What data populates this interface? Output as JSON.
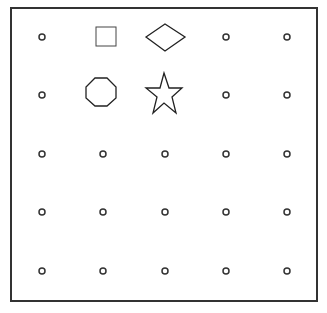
{
  "diagram": {
    "type": "grid-with-shapes",
    "frame": {
      "x": 11,
      "y": 8,
      "width": 306,
      "height": 293,
      "stroke": "#333333"
    },
    "grid": {
      "columns_x": [
        42,
        103,
        165,
        226,
        287
      ],
      "rows_y": [
        37,
        95,
        154,
        212,
        271
      ],
      "dot_radius": 3,
      "dot_stroke": "#333333"
    },
    "shapes": [
      {
        "kind": "square",
        "row": 0,
        "col": 1
      },
      {
        "kind": "diamond",
        "row": 0,
        "col": 2
      },
      {
        "kind": "octagon",
        "row": 1,
        "col": 1
      },
      {
        "kind": "star",
        "row": 1,
        "col": 2
      }
    ]
  }
}
